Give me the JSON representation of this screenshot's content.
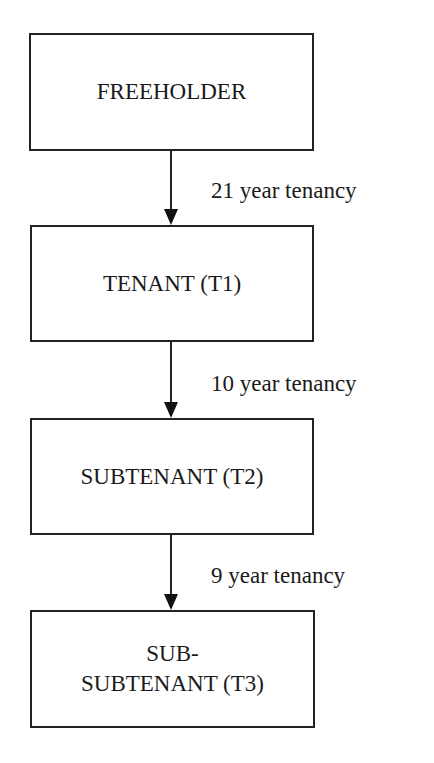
{
  "diagram": {
    "type": "flowchart",
    "direction": "top-to-bottom",
    "nodes": [
      {
        "id": "freeholder",
        "lines": [
          "FREEHOLDER"
        ]
      },
      {
        "id": "tenant",
        "lines": [
          "TENANT (T1)"
        ]
      },
      {
        "id": "subtenant",
        "lines": [
          "SUBTENANT (T2)"
        ]
      },
      {
        "id": "sub_subtenant",
        "lines": [
          "SUB-",
          "SUBTENANT (T3)"
        ]
      }
    ],
    "edges": [
      {
        "from": "freeholder",
        "to": "tenant",
        "label": "21 year tenancy"
      },
      {
        "from": "tenant",
        "to": "subtenant",
        "label": "10 year tenancy"
      },
      {
        "from": "subtenant",
        "to": "sub_subtenant",
        "label": "9 year tenancy"
      }
    ]
  }
}
